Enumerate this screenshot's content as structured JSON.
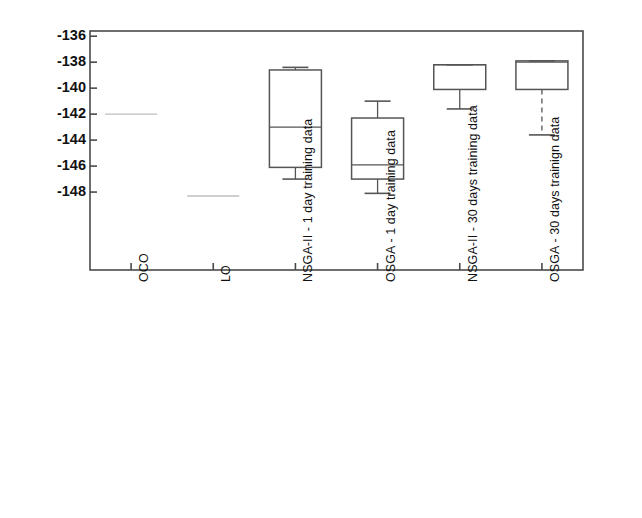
{
  "chart_data": {
    "type": "box",
    "title": "",
    "xlabel": "",
    "ylabel": "Balance [€]",
    "ylim": [
      -154.0,
      -135.6
    ],
    "yticks": [
      -136,
      -138,
      -140,
      -142,
      -144,
      -146,
      -148
    ],
    "ytick_labels": [
      "-136",
      "-138",
      "-140",
      "-142",
      "-144",
      "-146",
      "-148"
    ],
    "grid": false,
    "legend": "none",
    "categories": [
      "OCO",
      "LO",
      "NSGA-II - 1 day training data",
      "OSGA - 1 day training data",
      "NSGA-II - 30 days training data",
      "OSGA - 30 days trainign data"
    ],
    "boxes": [
      {
        "label": "OCO",
        "kind": "single-line",
        "median": -142.0,
        "q1": -142.0,
        "q3": -142.0,
        "whisker_low": -142.0,
        "whisker_high": -142.0,
        "whisker_style": "none",
        "line_color": "#bfbfbf"
      },
      {
        "label": "LO",
        "kind": "single-line",
        "median": -148.3,
        "q1": -148.3,
        "q3": -148.3,
        "whisker_low": -148.3,
        "whisker_high": -148.3,
        "whisker_style": "none",
        "line_color": "#bfbfbf"
      },
      {
        "label": "NSGA-II - 1 day training data",
        "kind": "box",
        "median": -143.0,
        "q1": -146.1,
        "q3": -138.6,
        "whisker_low": -147.0,
        "whisker_high": -138.4,
        "whisker_style": "solid",
        "line_color": "#555555"
      },
      {
        "label": "OSGA - 1 day training data",
        "kind": "box",
        "median": -145.9,
        "q1": -147.0,
        "q3": -142.3,
        "whisker_low": -148.1,
        "whisker_high": -141.0,
        "whisker_style": "solid",
        "line_color": "#555555"
      },
      {
        "label": "NSGA-II - 30 days training data",
        "kind": "box",
        "median": -138.2,
        "q1": -140.1,
        "q3": -138.2,
        "whisker_low": -141.6,
        "whisker_high": -138.2,
        "whisker_style": "solid",
        "line_color": "#555555"
      },
      {
        "label": "OSGA - 30 days trainign data",
        "kind": "box",
        "median": -138.0,
        "q1": -140.1,
        "q3": -137.9,
        "whisker_low": -143.6,
        "whisker_high": -137.9,
        "whisker_style": "dashed",
        "line_color": "#555555"
      }
    ]
  },
  "axes": {
    "frame_color": "#4a4a4a",
    "background": "#ffffff"
  }
}
